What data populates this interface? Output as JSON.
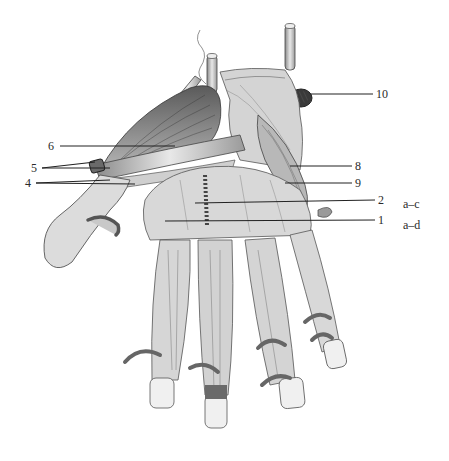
{
  "figure": {
    "style": "grayscale pencil/ink rendering on white background",
    "background": "#ffffff",
    "ink": "#2a2a2a"
  },
  "labels": [
    {
      "id": "10",
      "text": "10",
      "x": 376,
      "y": 88
    },
    {
      "id": "6",
      "text": "6",
      "x": 48,
      "y": 140
    },
    {
      "id": "5",
      "text": "5",
      "x": 31,
      "y": 163
    },
    {
      "id": "8",
      "text": "8",
      "x": 355,
      "y": 161
    },
    {
      "id": "4",
      "text": "4",
      "x": 25,
      "y": 178
    },
    {
      "id": "9",
      "text": "9",
      "x": 355,
      "y": 178
    },
    {
      "id": "2",
      "text": "2",
      "x": 378,
      "y": 195
    },
    {
      "id": "1",
      "text": "1",
      "x": 378,
      "y": 215
    }
  ],
  "range_labels": [
    {
      "id": "a-c",
      "text": "a–c",
      "x": 403,
      "y": 198
    },
    {
      "id": "a-d",
      "text": "a–d",
      "x": 403,
      "y": 220
    }
  ],
  "leaders": [
    {
      "label": "10",
      "from": [
        373,
        94
      ],
      "to": [
        310,
        94
      ]
    },
    {
      "label": "6",
      "from": [
        60,
        146
      ],
      "to": [
        175,
        146
      ]
    },
    {
      "label": "5a",
      "from": [
        42,
        168
      ],
      "to": [
        95,
        162
      ]
    },
    {
      "label": "5b",
      "from": [
        42,
        168
      ],
      "to": [
        110,
        168
      ]
    },
    {
      "label": "4a",
      "from": [
        36,
        183
      ],
      "to": [
        110,
        180
      ]
    },
    {
      "label": "4b",
      "from": [
        36,
        183
      ],
      "to": [
        135,
        184
      ]
    },
    {
      "label": "8",
      "from": [
        352,
        166
      ],
      "to": [
        290,
        166
      ]
    },
    {
      "label": "9",
      "from": [
        352,
        183
      ],
      "to": [
        285,
        183
      ]
    },
    {
      "label": "2",
      "from": [
        375,
        200
      ],
      "to": [
        195,
        203
      ]
    },
    {
      "label": "1",
      "from": [
        375,
        220
      ],
      "to": [
        165,
        221
      ]
    }
  ]
}
